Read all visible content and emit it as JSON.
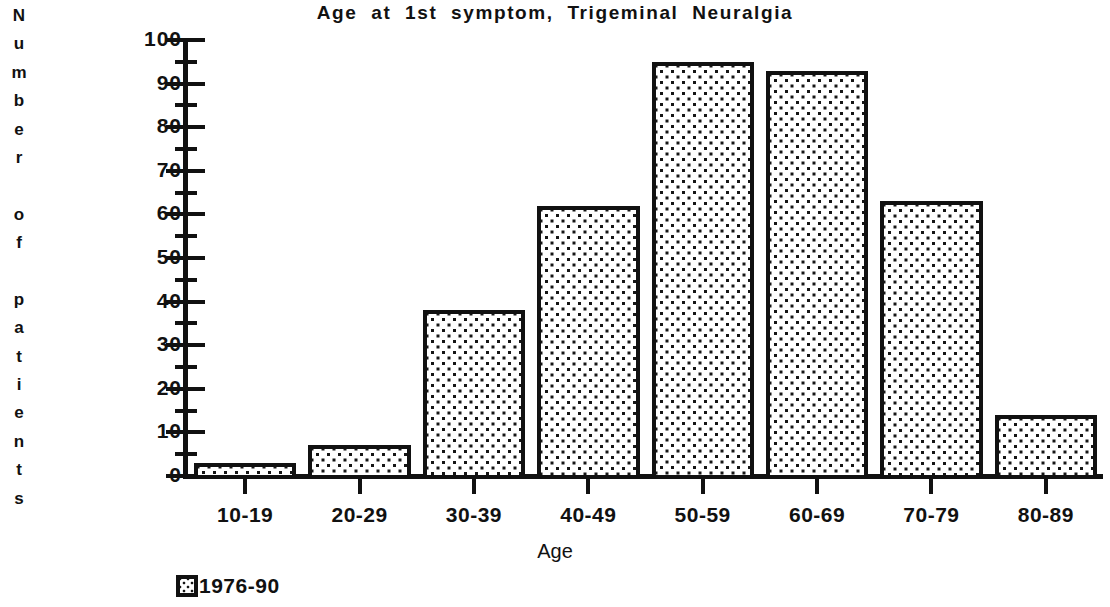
{
  "chart_data": {
    "type": "bar",
    "title": "Age  at  1st  symptom,  Trigeminal  Neuralgia",
    "xlabel": "Age",
    "ylabel": "Number of patients",
    "categories": [
      "10-19",
      "20-29",
      "30-39",
      "40-49",
      "50-59",
      "60-69",
      "70-79",
      "80-89"
    ],
    "values": [
      3,
      7,
      38,
      62,
      95,
      93,
      63,
      14
    ],
    "ylim": [
      0,
      100
    ],
    "ytick_labels": [
      "0",
      "10",
      "20",
      "30",
      "40",
      "50",
      "60",
      "70",
      "80",
      "90",
      "100"
    ],
    "ytick_values": [
      0,
      10,
      20,
      30,
      40,
      50,
      60,
      70,
      80,
      90,
      100
    ],
    "yminor_step": 5,
    "grid": false,
    "legend": [
      {
        "label": "1976-90",
        "swatch": "stipple-pattern"
      }
    ],
    "legend_position": "below-left",
    "bar_fill": "#ffffff",
    "bar_pattern": "dot-stipple",
    "bar_edge_color": "#111111",
    "axis_color": "#111111",
    "background": "#ffffff"
  },
  "ylabel_letters": [
    "N",
    "u",
    "m",
    "b",
    "e",
    "r",
    "",
    "o",
    "f",
    "",
    "p",
    "a",
    "t",
    "i",
    "e",
    "n",
    "t",
    "s"
  ]
}
